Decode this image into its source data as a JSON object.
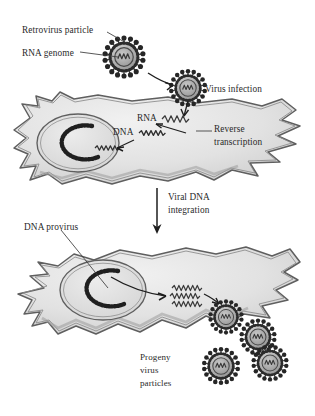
{
  "figure": {
    "type": "biological-process-diagram",
    "background_color": "#ffffff",
    "text_color": "#2a2a2a",
    "cell_fill": "#e3e3e3",
    "cell_outline": "#5a5a5a",
    "virus_color": "#6e6e6e"
  },
  "labels": {
    "retrovirus_particle": "Retrovirus particle",
    "rna_genome": "RNA genome",
    "virus_infection": "Virus infection",
    "rna": "RNA",
    "dna": "DNA",
    "reverse_transcription_line1": "Reverse",
    "reverse_transcription_line2": "transcription",
    "viral_dna_line1": "Viral DNA",
    "viral_dna_line2": "integration",
    "dna_provirus": "DNA provirus",
    "progeny_line1": "Progeny",
    "progeny_line2": "virus",
    "progeny_line3": "particles"
  },
  "steps": [
    {
      "order": 1,
      "name": "Retrovirus particle with RNA genome"
    },
    {
      "order": 2,
      "name": "Virus infection"
    },
    {
      "order": 3,
      "name": "Reverse transcription of RNA to DNA"
    },
    {
      "order": 4,
      "name": "Viral DNA integration"
    },
    {
      "order": 5,
      "name": "DNA provirus in host nucleus"
    },
    {
      "order": 6,
      "name": "Progeny virus particles"
    }
  ],
  "virus_particles": {
    "free_particle_count": 1,
    "infecting_particle_count": 1,
    "progeny_particle_count": 4,
    "spike_count": 18
  },
  "cells": {
    "upper": {
      "name": "infected host cell",
      "nucleus": 1
    },
    "lower": {
      "name": "provirus-containing host cell",
      "nucleus": 1
    }
  }
}
